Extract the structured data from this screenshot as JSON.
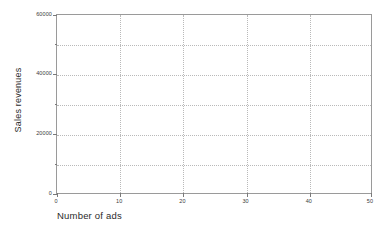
{
  "chart_data": {
    "type": "scatter",
    "title": "",
    "subtitle": "",
    "xlabel": "Number of ads",
    "ylabel": "Sales revenues",
    "xlim": [
      0,
      50
    ],
    "ylim": [
      0,
      60000
    ],
    "grid": true,
    "legend": null,
    "legend_position": "none",
    "x_ticks": [
      {
        "value": 0,
        "label": "0"
      },
      {
        "value": 10,
        "label": "10"
      },
      {
        "value": 20,
        "label": "20"
      },
      {
        "value": 30,
        "label": "30"
      },
      {
        "value": 40,
        "label": "40"
      },
      {
        "value": 50,
        "label": "50"
      }
    ],
    "x_tick_labels": [
      "0",
      "10",
      "20",
      "30",
      "40",
      "50"
    ],
    "x_gridlines": [
      10,
      20,
      30,
      40
    ],
    "y_ticks": [
      {
        "value": 0,
        "label": "0",
        "major": true
      },
      {
        "value": 10000,
        "label": "",
        "major": false
      },
      {
        "value": 20000,
        "label": "20000",
        "major": true
      },
      {
        "value": 30000,
        "label": "",
        "major": false
      },
      {
        "value": 40000,
        "label": "40000",
        "major": true
      },
      {
        "value": 50000,
        "label": "",
        "major": false
      },
      {
        "value": 60000,
        "label": "60000",
        "major": true
      }
    ],
    "y_tick_labels": [
      "0",
      "20000",
      "40000",
      "60000"
    ],
    "y_gridlines": [
      10000,
      20000,
      30000,
      40000,
      50000
    ],
    "series": [
      {
        "name": "",
        "x": [],
        "y": [],
        "values": []
      }
    ],
    "annotations": [],
    "data_points_count": 0,
    "note": "empty plot frame - axes and gridlines only, no data markers drawn"
  },
  "axes": {
    "y_title": "Sales revenues",
    "x_title": "Number of ads"
  },
  "colors": {
    "background": "#ffffff",
    "frame": "#9a9a9a",
    "gridline": "#b9b9b9",
    "tick": "#7a7a7a",
    "tick_label_text": "#3a3a3a",
    "axis_title_text": "#2b2b2b"
  }
}
